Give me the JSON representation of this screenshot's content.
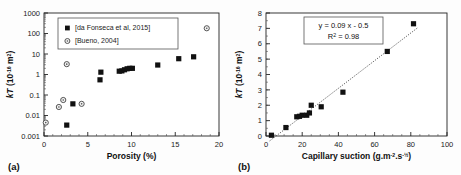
{
  "figure": {
    "panel_a_label": "(a)",
    "panel_b_label": "(b)"
  },
  "chart_data": [
    {
      "id": "panel-a",
      "type": "scatter",
      "title": "",
      "panel_label": "(a)",
      "xlabel": "Porosity (%)",
      "ylabel": "kT (10-16 m2)",
      "ylabel_parts": {
        "symbol": "kT",
        "unit_base": " (10",
        "unit_exp": "-16",
        "unit_tail": " m",
        "unit_tail_exp": "2",
        "close": ")"
      },
      "xscale": "linear",
      "yscale": "log",
      "xlim": [
        0,
        20
      ],
      "ylim": [
        0.001,
        1000
      ],
      "xticks": [
        0,
        5,
        10,
        15,
        20
      ],
      "xtick_labels": [
        "0",
        "5",
        "10",
        "15",
        "20"
      ],
      "yticks": [
        0.001,
        0.01,
        0.1,
        1,
        10,
        100,
        1000
      ],
      "ytick_labels": [
        "0.001",
        "0.01",
        "0.1",
        "1",
        "10",
        "100",
        "1000"
      ],
      "grid": false,
      "legend_position": "upper-left",
      "series": [
        {
          "name": "[da Fonseca et al, 2015]",
          "marker": "filled-square",
          "color": "#111111",
          "points": [
            {
              "x": 2.6,
              "y": 0.0034
            },
            {
              "x": 3.3,
              "y": 0.037
            },
            {
              "x": 6.4,
              "y": 0.55
            },
            {
              "x": 6.5,
              "y": 1.3
            },
            {
              "x": 8.6,
              "y": 1.45
            },
            {
              "x": 8.9,
              "y": 1.5
            },
            {
              "x": 9.2,
              "y": 1.7
            },
            {
              "x": 9.5,
              "y": 1.9
            },
            {
              "x": 9.8,
              "y": 2.0
            },
            {
              "x": 10.1,
              "y": 2.0
            },
            {
              "x": 13.0,
              "y": 2.9
            },
            {
              "x": 15.4,
              "y": 5.9
            },
            {
              "x": 17.1,
              "y": 7.3
            }
          ]
        },
        {
          "name": "[Bueno, 2004]",
          "marker": "open-circle",
          "color": "#555555",
          "points": [
            {
              "x": 0.2,
              "y": 0.0045
            },
            {
              "x": 1.7,
              "y": 0.026
            },
            {
              "x": 2.2,
              "y": 0.057
            },
            {
              "x": 2.6,
              "y": 3.2
            },
            {
              "x": 4.3,
              "y": 0.037
            },
            {
              "x": 18.6,
              "y": 180
            }
          ]
        }
      ]
    },
    {
      "id": "panel-b",
      "type": "scatter",
      "title": "",
      "panel_label": "(b)",
      "xlabel": "Capillary suction (g.m-2.s-1/2)",
      "xlabel_parts": {
        "head": "Capillary suction (g.m",
        "exp1": "-2",
        "mid": ".s",
        "exp2": "-½",
        "close": ")"
      },
      "ylabel": "kT (10-16 m2)",
      "xscale": "linear",
      "yscale": "linear",
      "xlim": [
        0,
        100
      ],
      "ylim": [
        0,
        8
      ],
      "xticks": [
        0,
        20,
        40,
        60,
        80,
        100
      ],
      "xtick_labels": [
        "0",
        "20",
        "40",
        "60",
        "80",
        "100"
      ],
      "yticks": [
        0,
        1,
        2,
        3,
        4,
        5,
        6,
        7,
        8
      ],
      "ytick_labels": [
        "0",
        "1",
        "2",
        "3",
        "4",
        "5",
        "6",
        "7",
        "8"
      ],
      "grid": false,
      "annotation": {
        "equation": "y = 0.09 x - 0.5",
        "r_squared_label": "R2 = 0.98",
        "r_squared_parts": {
          "head": "R",
          "exp": "2",
          "tail": " = 0.98"
        }
      },
      "trendline": {
        "slope": 0.09,
        "intercept": -0.5,
        "style": "dotted",
        "x_from": 2,
        "x_to": 84
      },
      "series": [
        {
          "name": "measurements",
          "marker": "filled-square",
          "color": "#111111",
          "points": [
            {
              "x": 3.0,
              "y": 0.05
            },
            {
              "x": 11.0,
              "y": 0.55
            },
            {
              "x": 17.0,
              "y": 1.25
            },
            {
              "x": 18.5,
              "y": 1.28
            },
            {
              "x": 20.0,
              "y": 1.35
            },
            {
              "x": 22.5,
              "y": 1.35
            },
            {
              "x": 24.0,
              "y": 1.5
            },
            {
              "x": 25.0,
              "y": 2.0
            },
            {
              "x": 30.5,
              "y": 1.9
            },
            {
              "x": 42.5,
              "y": 2.85
            },
            {
              "x": 67.0,
              "y": 5.5
            },
            {
              "x": 81.5,
              "y": 7.3
            }
          ]
        }
      ]
    }
  ]
}
